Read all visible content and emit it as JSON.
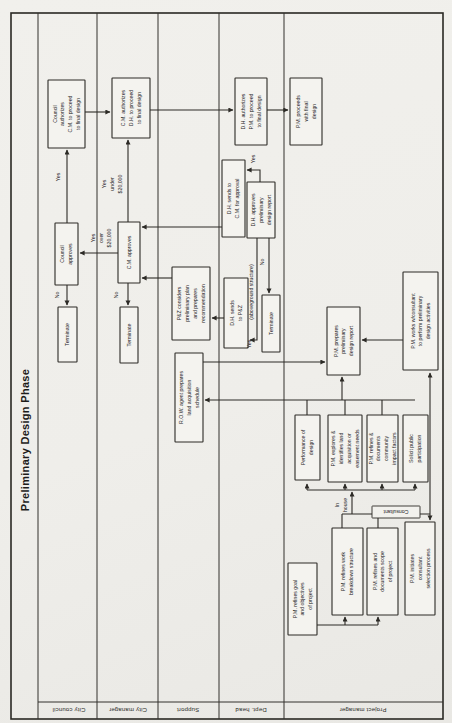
{
  "title": "Preliminary Design Phase",
  "lanes": [
    {
      "label": "City council",
      "cx": 69,
      "cy": 710
    },
    {
      "label": "City manager",
      "cx": 128,
      "cy": 710
    },
    {
      "label": "Support",
      "cx": 188,
      "cy": 710
    },
    {
      "label": "Dept. head",
      "cx": 251,
      "cy": 710
    },
    {
      "label": "Project manager",
      "cx": 363,
      "cy": 710
    }
  ],
  "frame": {
    "x": 11,
    "y": 13,
    "w": 432,
    "h": 706
  },
  "grid": {
    "lane_lines_x": [
      38,
      97,
      158,
      219,
      284
    ],
    "lane_top_y": 13,
    "lane_bottom_y": 719,
    "label_row_y": 702,
    "label_row_x1": 38,
    "label_row_x2": 443
  },
  "nodes": [
    {
      "id": "council-authorizes-box",
      "x": 48,
      "y": 80,
      "w": 37,
      "h": 68,
      "rot": -90,
      "lines": [
        "Council",
        "authorizes",
        "C.M. to proceed",
        "to final design"
      ]
    },
    {
      "id": "council-approves-box",
      "x": 55,
      "y": 223,
      "w": 23,
      "h": 62,
      "rot": -90,
      "lines": [
        "Council",
        "approves"
      ]
    },
    {
      "id": "terminate-council-box",
      "x": 58,
      "y": 307,
      "w": 19,
      "h": 55,
      "rot": -90,
      "lines": [
        "Terminate"
      ]
    },
    {
      "id": "cm-authorizes-box",
      "x": 112,
      "y": 78,
      "w": 38,
      "h": 60,
      "rot": -90,
      "lines": [
        "C.M. authorizes",
        "D.H. to proceed",
        "to final design"
      ]
    },
    {
      "id": "cm-approves-box",
      "x": 118,
      "y": 222,
      "w": 22,
      "h": 61,
      "rot": -90,
      "lines": [
        "C.M. approves"
      ]
    },
    {
      "id": "terminate-cm-box",
      "x": 120,
      "y": 307,
      "w": 18,
      "h": 56,
      "rot": -90,
      "lines": [
        "Terminate"
      ]
    },
    {
      "id": "pz-considers-box",
      "x": 172,
      "y": 267,
      "w": 38,
      "h": 73,
      "rot": -90,
      "lines": [
        "P&Z considers",
        "preliminary plan",
        "and prepares",
        "recommendation"
      ]
    },
    {
      "id": "row-agent-box",
      "x": 175,
      "y": 353,
      "w": 28,
      "h": 89,
      "rot": -90,
      "lines": [
        "R.O.W. agent prepares",
        "land acquisition",
        "schedule"
      ]
    },
    {
      "id": "dh-authorizes-box",
      "x": 235,
      "y": 78,
      "w": 32,
      "h": 67,
      "rot": -90,
      "lines": [
        "D.H. authorizes",
        "P.M. to proceed",
        "to final design"
      ]
    },
    {
      "id": "dh-sends-to-cm-box",
      "x": 222,
      "y": 160,
      "w": 23,
      "h": 77,
      "rot": -90,
      "lines": [
        "D.H. sends to",
        "C.M. for approval"
      ]
    },
    {
      "id": "dh-approves-box",
      "x": 247,
      "y": 182,
      "w": 28,
      "h": 56,
      "rot": -90,
      "lines": [
        "D.H. approves",
        "preliminary",
        "design report"
      ]
    },
    {
      "id": "dh-sends-to-pz-box",
      "x": 224,
      "y": 278,
      "w": 24,
      "h": 70,
      "rot": -90,
      "lines": [
        "D.H. sends",
        "to P&Z"
      ]
    },
    {
      "id": "terminate-dh-box",
      "x": 262,
      "y": 295,
      "w": 18,
      "h": 57,
      "rot": -90,
      "lines": [
        "Terminate"
      ]
    },
    {
      "id": "pm-proceeds-box",
      "x": 290,
      "y": 78,
      "w": 32,
      "h": 67,
      "rot": -90,
      "lines": [
        "P.M. proceeds",
        "with final",
        "design"
      ]
    },
    {
      "id": "pm-works-consultant-box",
      "x": 403,
      "y": 272,
      "w": 35,
      "h": 98,
      "rot": -90,
      "lines": [
        "P.M. works w/consultant",
        "to perform preliminary",
        "design activities"
      ]
    },
    {
      "id": "pm-prepares-report-box",
      "x": 327,
      "y": 307,
      "w": 33,
      "h": 68,
      "rot": -90,
      "lines": [
        "P.M. prepares",
        "preliminary",
        "design report"
      ]
    },
    {
      "id": "performance-of-design-box",
      "x": 295,
      "y": 415,
      "w": 25,
      "h": 65,
      "rot": -90,
      "lines": [
        "Performance of",
        "design"
      ]
    },
    {
      "id": "pm-explores-land-box",
      "x": 328,
      "y": 415,
      "w": 34,
      "h": 67,
      "rot": -90,
      "lines": [
        "P.M. explores &",
        "identifies land",
        "acquisition or",
        "easement needs"
      ]
    },
    {
      "id": "pm-community-impact-box",
      "x": 367,
      "y": 415,
      "w": 31,
      "h": 67,
      "rot": -90,
      "lines": [
        "P.M. refines &",
        "documents",
        "community",
        "impact factors"
      ]
    },
    {
      "id": "solicit-public-box",
      "x": 403,
      "y": 415,
      "w": 25,
      "h": 67,
      "rot": -90,
      "lines": [
        "Solicit public",
        "participation"
      ]
    },
    {
      "id": "pm-goal-objectives-box",
      "x": 288,
      "y": 563,
      "w": 29,
      "h": 72,
      "rot": -90,
      "lines": [
        "P.M. refines goal",
        "and objectives",
        "of project"
      ]
    },
    {
      "id": "pm-wbs-box",
      "x": 332,
      "y": 528,
      "w": 31,
      "h": 87,
      "rot": -90,
      "lines": [
        "P.M. refines work",
        "breakdown structure"
      ]
    },
    {
      "id": "pm-scope-box",
      "x": 367,
      "y": 528,
      "w": 31,
      "h": 87,
      "rot": -90,
      "lines": [
        "P.M. refines and",
        "documents scope",
        "of project"
      ]
    },
    {
      "id": "pm-initiates-selection-box",
      "x": 405,
      "y": 522,
      "w": 30,
      "h": 93,
      "rot": -90,
      "lines": [
        "P.M. initiates",
        "consultant",
        "selection process"
      ]
    },
    {
      "id": "consultant-tag",
      "x": 372,
      "y": 506,
      "w": 48,
      "h": 12,
      "rot": 180,
      "tag": true,
      "lines": [
        "Consultant"
      ]
    }
  ],
  "float_labels": [
    {
      "id": "label-yes-council",
      "cx": 58,
      "cy": 177,
      "rot": -90,
      "lines": [
        "Yes"
      ]
    },
    {
      "id": "label-yes-under-20000",
      "cx": 112,
      "cy": 184,
      "rot": -90,
      "lines": [
        "Yes",
        "under",
        "$20,000"
      ]
    },
    {
      "id": "label-yes-over-20000",
      "cx": 101,
      "cy": 238,
      "rot": -90,
      "lines": [
        "Yes",
        "over",
        "$20,000"
      ]
    },
    {
      "id": "label-no-council",
      "cx": 57,
      "cy": 295,
      "rot": -90,
      "lines": [
        "No"
      ]
    },
    {
      "id": "label-no-cm",
      "cx": 116,
      "cy": 295,
      "rot": -90,
      "lines": [
        "No"
      ]
    },
    {
      "id": "label-yes-dh",
      "cx": 253,
      "cy": 159,
      "rot": -90,
      "lines": [
        "Yes"
      ]
    },
    {
      "id": "label-no-dh",
      "cx": 262,
      "cy": 262,
      "rot": -90,
      "lines": [
        "No"
      ]
    },
    {
      "id": "label-aboveground",
      "cx": 251,
      "cy": 292,
      "rot": -90,
      "lines": [
        "(aboveground structure)"
      ]
    },
    {
      "id": "label-yes-pz",
      "cx": 249,
      "cy": 344,
      "rot": -90,
      "lines": [
        "Yes"
      ]
    },
    {
      "id": "label-in-house",
      "cx": 341,
      "cy": 505,
      "rot": -90,
      "lines": [
        "In",
        "house"
      ]
    }
  ],
  "edges": [
    {
      "id": "edge-council-to-cm-auth",
      "d": "M85,112 H110",
      "arrow": true
    },
    {
      "id": "edge-cm-to-dh-auth",
      "d": "M150,110 H233",
      "arrow": true
    },
    {
      "id": "edge-dh-auth-to-pm-proceeds",
      "d": "M267,110 H288",
      "arrow": true
    },
    {
      "id": "edge-council-approves-yes",
      "d": "M67,223 V150",
      "arrow": true
    },
    {
      "id": "edge-cm-approves-yes-under",
      "d": "M128,222 V140",
      "arrow": true
    },
    {
      "id": "edge-cm-approves-yes-over",
      "d": "M118,253 H80",
      "arrow": true
    },
    {
      "id": "edge-council-no-terminate",
      "d": "M67,285 V305",
      "arrow": true
    },
    {
      "id": "edge-cm-no-terminate",
      "d": "M128,283 V305",
      "arrow": true
    },
    {
      "id": "edge-dh-sends-cm-to-cm-approves",
      "d": "M222,227 H142",
      "arrow": true
    },
    {
      "id": "edge-pz-to-cm-approves",
      "d": "M172,278 H142",
      "arrow": true
    },
    {
      "id": "edge-dh-approves-yes",
      "d": "M260,182 L260,170 L247,170",
      "arrow": true
    },
    {
      "id": "edge-dh-approves-aboveground",
      "d": "M257,238 L257,340 L250,340",
      "arrow": true
    },
    {
      "id": "edge-dh-no-terminate",
      "d": "M269,238 V293",
      "arrow": true
    },
    {
      "id": "edge-dh-sends-pz-to-pz",
      "d": "M224,318 H212",
      "arrow": true
    },
    {
      "id": "edge-row-to-pm-prepares",
      "d": "M203,362 H325",
      "arrow": true
    },
    {
      "id": "edge-collector-to-row",
      "d": "M415,400 H205",
      "arrow": true
    },
    {
      "id": "edge-stub-performance-top",
      "d": "M307,400 V415",
      "arrow": false
    },
    {
      "id": "edge-stub-explores-top",
      "d": "M345,400 V415",
      "arrow": false
    },
    {
      "id": "edge-stub-community-top",
      "d": "M382,400 V415",
      "arrow": false
    },
    {
      "id": "edge-collector-to-pm-prepares",
      "d": "M342,400 V377",
      "arrow": true
    },
    {
      "id": "edge-works-to-pm-prepares",
      "d": "M403,340 H362",
      "arrow": true
    },
    {
      "id": "edge-lower-collector",
      "d": "M307,490 H415",
      "arrow": false
    },
    {
      "id": "edge-arrow-performance-bottom",
      "d": "M307,490 V484",
      "arrow": true
    },
    {
      "id": "edge-arrow-explores-bottom",
      "d": "M345,490 V484",
      "arrow": true
    },
    {
      "id": "edge-arrow-community-bottom",
      "d": "M382,490 V484",
      "arrow": true
    },
    {
      "id": "edge-arrow-solicit-bottom",
      "d": "M415,490 V484",
      "arrow": true
    },
    {
      "id": "edge-in-house",
      "d": "M352,514 V492",
      "arrow": true
    },
    {
      "id": "edge-wbs-top-stub",
      "d": "M342,528 V514",
      "arrow": false
    },
    {
      "id": "edge-scope-top-stub",
      "d": "M378,528 V514",
      "arrow": false
    },
    {
      "id": "edge-split-horizontal",
      "d": "M342,514 H430",
      "arrow": false
    },
    {
      "id": "edge-consultant-down",
      "d": "M430,514 V520",
      "arrow": true
    },
    {
      "id": "edge-consultant-up",
      "d": "M430,514 V373",
      "arrow": true
    },
    {
      "id": "edge-goal-chain",
      "d": "M317,625 H378",
      "arrow": false
    },
    {
      "id": "edge-goal-to-wbs",
      "d": "M345,625 V617",
      "arrow": true
    },
    {
      "id": "edge-goal-to-scope",
      "d": "M378,625 V617",
      "arrow": true
    }
  ],
  "colors": {
    "ink": "#2c2a26",
    "paper": "#f1f0ec",
    "box_fill": "#f4f3ef"
  },
  "font_sizes": {
    "node": 5.2,
    "label": 5.2,
    "lane": 6,
    "title": 11
  }
}
